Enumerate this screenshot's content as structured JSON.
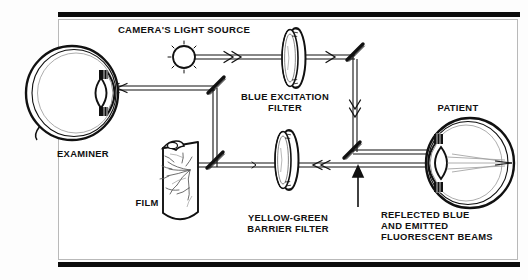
{
  "figure": {
    "title_type": "optical-path-diagram"
  },
  "labels": {
    "light_source": "CAMERA'S LIGHT SOURCE",
    "blue_filter": "BLUE EXCITATION\nFILTER",
    "examiner": "EXAMINER",
    "film": "FILM",
    "patient": "PATIENT",
    "barrier_filter": "YELLOW-GREEN\nBARRIER FILTER",
    "beams": "REFLECTED BLUE\nAND EMITTED\nFLUORESCENT BEAMS"
  },
  "components": [
    {
      "name": "camera-light-source",
      "kind": "lamp",
      "x": 184,
      "y": 55
    },
    {
      "name": "blue-excitation-filter",
      "kind": "filter-ring",
      "x": 296,
      "y": 58
    },
    {
      "name": "yellow-green-barrier-filter",
      "kind": "filter-ring",
      "x": 289,
      "y": 160
    },
    {
      "name": "examiner-eye",
      "kind": "eye",
      "facing": "right",
      "x": 75,
      "y": 93
    },
    {
      "name": "patient-eye",
      "kind": "eye",
      "facing": "left",
      "x": 458,
      "y": 163
    },
    {
      "name": "film-sheet",
      "kind": "film",
      "x": 185,
      "y": 175
    },
    {
      "name": "mirror-upper-left",
      "kind": "mirror",
      "x": 216,
      "y": 85
    },
    {
      "name": "mirror-upper-right",
      "kind": "mirror",
      "x": 355,
      "y": 52
    },
    {
      "name": "mirror-lower-left",
      "kind": "mirror",
      "x": 215,
      "y": 160
    },
    {
      "name": "mirror-lower-right",
      "kind": "mirror",
      "x": 352,
      "y": 150
    }
  ],
  "colors": {
    "ink": "#111111",
    "rule": "#0c0c0c",
    "frame": "#b9b9b9",
    "page": "#ffffff"
  }
}
